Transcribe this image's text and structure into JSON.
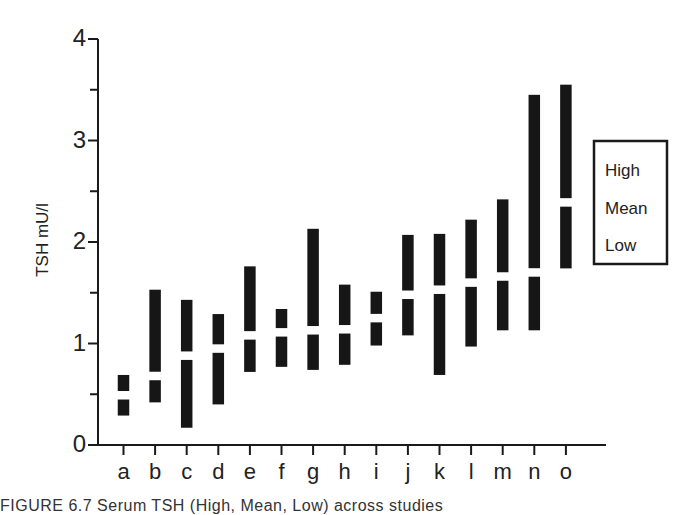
{
  "chart_data": {
    "type": "bar",
    "subtype": "floating-range",
    "title": "",
    "xlabel": "",
    "ylabel": "TSH mU/l",
    "ylim": [
      0,
      4
    ],
    "yticks": [
      "0",
      "1",
      "2",
      "3",
      "4"
    ],
    "yminor_ticks": [
      0.5,
      1.5,
      2.5,
      3.5
    ],
    "grid": false,
    "legend": {
      "position": "right",
      "entries": [
        "High",
        "Mean",
        "Low"
      ]
    },
    "categories": [
      "a",
      "b",
      "c",
      "d",
      "e",
      "f",
      "g",
      "h",
      "i",
      "j",
      "k",
      "l",
      "m",
      "n",
      "o"
    ],
    "series": [
      {
        "name": "High",
        "values": [
          0.69,
          1.53,
          1.43,
          1.29,
          1.76,
          1.34,
          2.13,
          1.58,
          1.51,
          2.07,
          2.08,
          2.22,
          2.42,
          3.45,
          3.55
        ]
      },
      {
        "name": "Mean",
        "values": [
          0.49,
          0.68,
          0.88,
          0.95,
          1.08,
          1.11,
          1.13,
          1.14,
          1.25,
          1.48,
          1.53,
          1.6,
          1.66,
          1.7,
          2.39
        ]
      },
      {
        "name": "Low",
        "values": [
          0.29,
          0.42,
          0.17,
          0.4,
          0.72,
          0.77,
          0.74,
          0.79,
          0.98,
          1.08,
          0.69,
          0.97,
          1.13,
          1.13,
          1.74
        ]
      }
    ]
  },
  "caption": "FIGURE 6.7  Serum TSH (High, Mean, Low) across studies",
  "colors": {
    "bar": "#161616",
    "axis": "#1a1a1a",
    "background": "#ffffff"
  }
}
